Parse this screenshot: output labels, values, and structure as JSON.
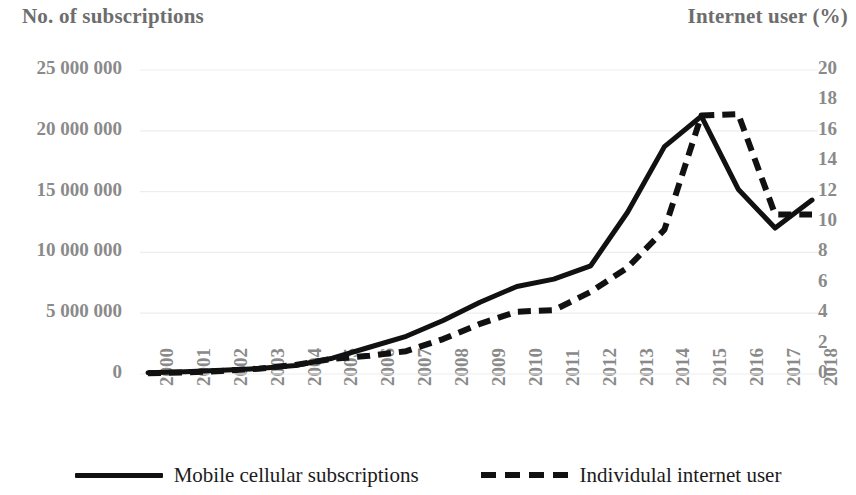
{
  "chart_data": {
    "type": "line",
    "title": "",
    "xlabel": "",
    "x": [
      2000,
      2001,
      2002,
      2003,
      2004,
      2005,
      2006,
      2007,
      2008,
      2009,
      2010,
      2011,
      2012,
      2013,
      2014,
      2015,
      2016,
      2017,
      2018
    ],
    "categories": [
      "2000",
      "2001",
      "2002",
      "2003",
      "2004",
      "2005",
      "2006",
      "2007",
      "2008",
      "2009",
      "2010",
      "2011",
      "2012",
      "2013",
      "2014",
      "2015",
      "2016",
      "2017",
      "2018"
    ],
    "grid": true,
    "legend_position": "bottom",
    "axes": {
      "left": {
        "title": "No. of subscriptions",
        "ylim": [
          0,
          25000000
        ],
        "tick_step": 5000000,
        "tick_labels": [
          "25 000 000",
          "20 000 000",
          "15 000 000",
          "10 000 000",
          "5 000 000",
          "0"
        ],
        "tick_values": [
          25000000,
          20000000,
          15000000,
          10000000,
          5000000,
          0
        ]
      },
      "right": {
        "title": "Internet user (%)",
        "ylim": [
          0,
          20
        ],
        "tick_step": 2,
        "tick_labels": [
          "20",
          "18",
          "16",
          "14",
          "12",
          "10",
          "8",
          "6",
          "4",
          "2",
          "0"
        ],
        "tick_values": [
          20,
          18,
          16,
          14,
          12,
          10,
          8,
          6,
          4,
          2,
          0
        ]
      }
    },
    "series": [
      {
        "name": "Mobile cellular subscriptions",
        "axis": "left",
        "style": "solid",
        "color": "#111111",
        "values": [
          100000,
          180000,
          300000,
          450000,
          700000,
          1300000,
          2200000,
          3100000,
          4400000,
          5900000,
          7200000,
          7800000,
          8900000,
          13300000,
          18700000,
          21200000,
          15200000,
          12000000,
          14300000
        ]
      },
      {
        "name": "Individulal internet user",
        "axis": "right",
        "style": "dashed",
        "color": "#111111",
        "values": [
          0.05,
          0.1,
          0.2,
          0.35,
          0.6,
          1.0,
          1.2,
          1.5,
          2.3,
          3.3,
          4.1,
          4.2,
          5.4,
          7.0,
          9.5,
          17.0,
          17.1,
          10.5,
          10.5
        ]
      }
    ]
  },
  "legend": {
    "items": [
      {
        "label": "Mobile cellular subscriptions",
        "style": "solid"
      },
      {
        "label": "Individulal internet user",
        "style": "dashed"
      }
    ]
  }
}
